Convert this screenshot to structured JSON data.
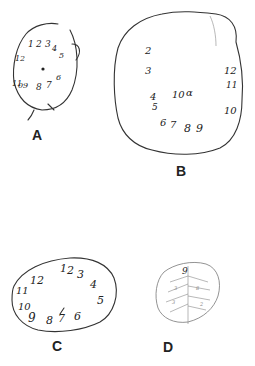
{
  "figure": {
    "panels": [
      {
        "id": "A",
        "label": "A",
        "description": "Small clock drawing with numbers crowded on left/top side",
        "numbers": [
          "1",
          "2",
          "3",
          "4",
          "5",
          "12",
          "6",
          "11",
          "10",
          "9",
          "8",
          "7"
        ]
      },
      {
        "id": "B",
        "label": "B",
        "description": "Large irregular clock outline with numbers scattered along edges",
        "numbers": [
          "1",
          "2",
          "3",
          "4",
          "5",
          "6",
          "7",
          "8",
          "9",
          "10",
          "11",
          "12",
          "10"
        ]
      },
      {
        "id": "C",
        "label": "C",
        "description": "Oval clock with all numbers drawn around the rim",
        "numbers": [
          "12",
          "1",
          "2",
          "3",
          "4",
          "5",
          "6",
          "7",
          "8",
          "9",
          "10",
          "11"
        ]
      },
      {
        "id": "D",
        "label": "D",
        "description": "Leaf-shaped drawing with central vein and faint numbers",
        "numbers": [
          "9"
        ]
      }
    ]
  }
}
